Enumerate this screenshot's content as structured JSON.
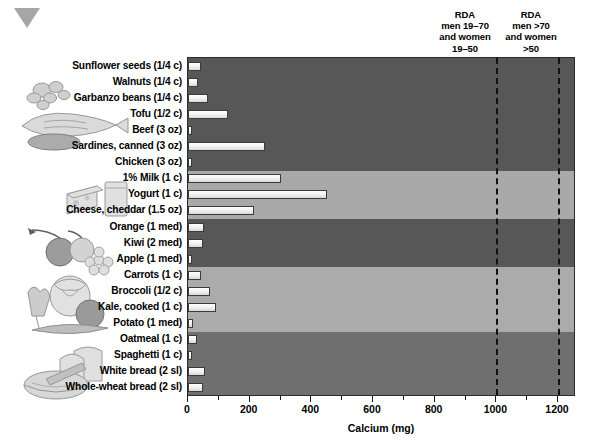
{
  "marker": {
    "icon": "triangle-down-marker",
    "color": "#a6a6a6"
  },
  "annotations": {
    "rda_1": {
      "line1": "RDA",
      "line2": "men 19–70",
      "line3": "and women",
      "line4": "19–50",
      "value": 1000
    },
    "rda_2": {
      "line1": "RDA",
      "line2": "men >70",
      "line3": "and women",
      "line4": ">50",
      "value": 1200
    }
  },
  "axis": {
    "title": "Calcium (mg)",
    "ticks": [
      0,
      200,
      400,
      600,
      800,
      1000,
      1200
    ],
    "minor_ticks": [
      100,
      300,
      500,
      700,
      900,
      1100
    ],
    "min": 0,
    "max": 1255
  },
  "groups": [
    {
      "name": "protein-foods",
      "art": "nuts-fish-meat",
      "band_color": "#575757",
      "count": 7
    },
    {
      "name": "dairy-foods",
      "art": "cheese-milk",
      "band_color": "#a9a9a9",
      "count": 3
    },
    {
      "name": "fruits",
      "art": "fruit-bowl",
      "band_color": "#575757",
      "count": 3
    },
    {
      "name": "vegetables",
      "art": "vegetables",
      "band_color": "#ababab",
      "count": 4
    },
    {
      "name": "grains",
      "art": "bread-cereal",
      "band_color": "#6f6f6f",
      "count": 4
    }
  ],
  "chart_data": {
    "type": "bar",
    "orientation": "horizontal",
    "title": "",
    "xlabel": "Calcium (mg)",
    "ylabel": "",
    "xlim": [
      0,
      1255
    ],
    "grid": false,
    "categories": [
      "Sunflower seeds (1/4 c)",
      "Walnuts (1/4 c)",
      "Garbanzo beans (1/4 c)",
      "Tofu (1/2 c)",
      "Beef (3 oz)",
      "Sardines, canned (3 oz)",
      "Chicken (3 oz)",
      "1% Milk (1 c)",
      "Yogurt (1 c)",
      "Cheese, cheddar (1.5 oz)",
      "Orange (1 med)",
      "Kiwi (2 med)",
      "Apple (1 med)",
      "Carrots (1 c)",
      "Broccoli (1/2 c)",
      "Kale, cooked (1 c)",
      "Potato (1 med)",
      "Oatmeal (1 c)",
      "Spaghetti (1 c)",
      "White bread (2 sl)",
      "Whole-wheat bread (2 sl)"
    ],
    "values": [
      42,
      32,
      65,
      130,
      10,
      250,
      12,
      300,
      450,
      215,
      52,
      50,
      10,
      42,
      70,
      90,
      15,
      30,
      14,
      55,
      48
    ],
    "units": "mg",
    "reference_lines": [
      {
        "label": "RDA men 19–70 and women 19–50",
        "value": 1000
      },
      {
        "label": "RDA men >70 and women >50",
        "value": 1200
      }
    ],
    "group_assignment": [
      "protein-foods",
      "protein-foods",
      "protein-foods",
      "protein-foods",
      "protein-foods",
      "protein-foods",
      "protein-foods",
      "dairy-foods",
      "dairy-foods",
      "dairy-foods",
      "fruits",
      "fruits",
      "fruits",
      "vegetables",
      "vegetables",
      "vegetables",
      "vegetables",
      "grains",
      "grains",
      "grains",
      "grains"
    ]
  }
}
